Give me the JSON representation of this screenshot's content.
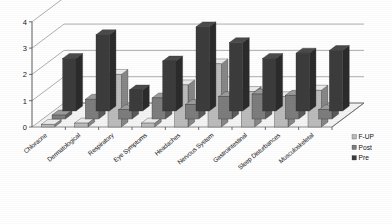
{
  "chart_data": {
    "type": "bar",
    "title": "",
    "subtitle": "",
    "xlabel": "",
    "ylabel": "",
    "ylim": [
      0,
      4
    ],
    "ytick_labels": [
      "0",
      "1",
      "2",
      "3",
      "4"
    ],
    "grid": true,
    "three_d": true,
    "legend_position": "bottom-right",
    "categories": [
      "Chloracne",
      "Dermatological",
      "Respiratory",
      "Eye Symptoms",
      "Headaches",
      "Nervous System",
      "Gastrointestinal",
      "Sleep Disturbances",
      "Musculoskeletal"
    ],
    "series": [
      {
        "name": "Pre",
        "color": "#3c3c3c",
        "values": [
          2.0,
          2.9,
          0.8,
          1.9,
          3.2,
          2.6,
          2.0,
          2.2,
          2.3
        ]
      },
      {
        "name": "Post",
        "color": "#7d7d7d",
        "values": [
          0.15,
          0.75,
          0.35,
          0.8,
          0.55,
          0.85,
          0.95,
          0.9,
          0.35
        ]
      },
      {
        "name": "F-UP",
        "color": "#bcbcbc",
        "values": [
          0.1,
          0.15,
          2.0,
          0.15,
          1.6,
          2.4,
          1.35,
          1.15,
          1.4
        ]
      }
    ]
  },
  "legend": {
    "entries": [
      {
        "label": "F-UP",
        "color": "#bcbcbc"
      },
      {
        "label": "Post",
        "color": "#7d7d7d"
      },
      {
        "label": "Pre",
        "color": "#3c3c3c"
      }
    ]
  },
  "axis": {
    "y_ticks": [
      "4",
      "3",
      "2",
      "1",
      "0"
    ]
  }
}
